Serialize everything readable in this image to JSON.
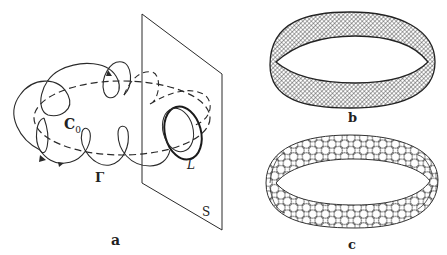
{
  "figure": {
    "panels": [
      {
        "id": "a",
        "caption": "a",
        "labels": {
          "core_curve": "C",
          "core_curve_sub": "0",
          "trajectory": "Γ",
          "loop": "L",
          "section_plane": "S"
        }
      },
      {
        "id": "b",
        "caption": "b"
      },
      {
        "id": "c",
        "caption": "c"
      }
    ],
    "colors": {
      "stroke": "#2a2a2a",
      "background": "#ffffff"
    }
  }
}
